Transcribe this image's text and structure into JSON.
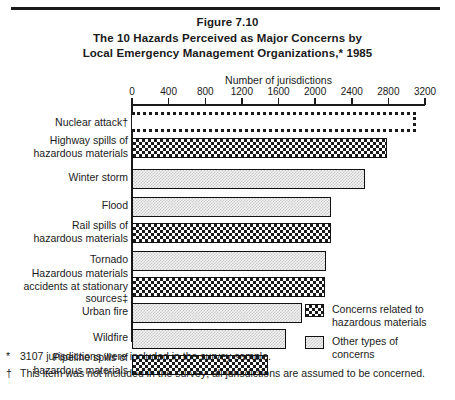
{
  "figure": {
    "number_label": "Figure 7.10",
    "title_line1": "The 10 Hazards Perceived as Major Concerns by",
    "title_line2": "Local Emergency Management Organizations,*  1985"
  },
  "axis": {
    "title": "Number of jurisdictions",
    "ticks": [
      "0",
      "400",
      "800",
      "1200",
      "1600",
      "2000",
      "2400",
      "2800",
      "3200"
    ]
  },
  "legend": {
    "items": [
      {
        "label": "Concerns related to\nhazardous materials",
        "pattern": "hazard",
        "swatch_name": "legend-swatch-hazard"
      },
      {
        "label": "Other types of\nconcerns",
        "pattern": "other",
        "swatch_name": "legend-swatch-other"
      }
    ]
  },
  "notes": [
    {
      "marker": "*",
      "text": "3107 jurisdictions were included in the survey sample."
    },
    {
      "marker": "†",
      "text": "This item was not included in the survey; all jurisdictions are assumed to be concerned."
    }
  ],
  "chart_data": {
    "type": "bar",
    "orientation": "horizontal",
    "title": "The 10 Hazards Perceived as Major Concerns by Local Emergency Management Organizations,* 1985",
    "subtitle": "Figure 7.10",
    "xlabel": "Number of jurisdictions",
    "ylabel": "",
    "xlim": [
      0,
      3200
    ],
    "xticks": [
      0,
      400,
      800,
      1200,
      1600,
      2000,
      2400,
      2800,
      3200
    ],
    "grid": false,
    "legend_position": "bottom-right",
    "categories": [
      "Nuclear attack†",
      "Highway spills of\nhazardous materials",
      "Winter storm",
      "Flood",
      "Rail spills of\nhazardous materials",
      "Tornado",
      "Hazardous materials\naccidents at stationary\nsources‡",
      "Urban fire",
      "Wildfire",
      "Pipeline spills of\nhazardous materials"
    ],
    "values": [
      3107,
      2780,
      2540,
      2170,
      2170,
      2120,
      2110,
      1860,
      1680,
      1490
    ],
    "series_group": [
      "not-surveyed",
      "hazard",
      "other",
      "other",
      "hazard",
      "other",
      "hazard",
      "other",
      "other",
      "hazard"
    ],
    "legend": [
      "Concerns related to hazardous materials",
      "Other types of concerns"
    ]
  }
}
